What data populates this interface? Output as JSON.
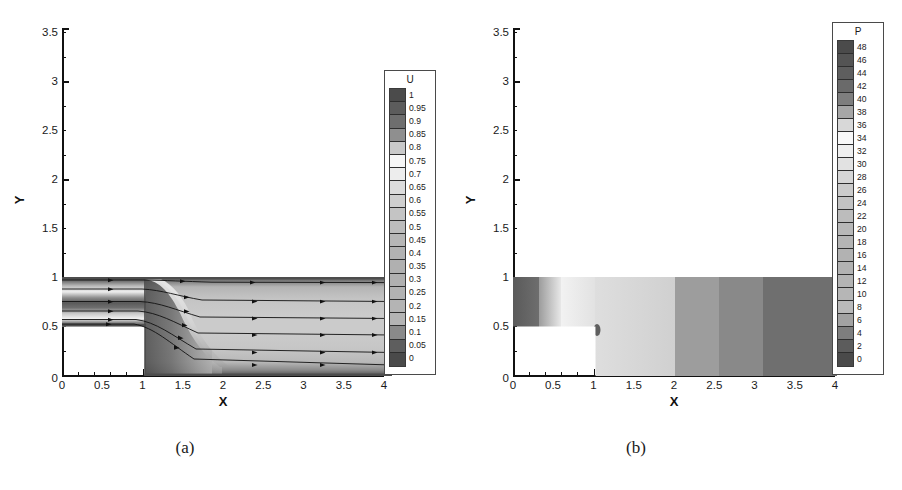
{
  "figure": {
    "panels": [
      {
        "id": "a",
        "caption": "(a)",
        "xlabel": "X",
        "ylabel": "Y",
        "xticks": [
          "0",
          "0.5",
          "1",
          "1.5",
          "2",
          "2.5",
          "3",
          "3.5",
          "4"
        ],
        "yticks": [
          "0",
          "0.5",
          "1",
          "1.5",
          "2",
          "2.5",
          "3",
          "3.5"
        ],
        "colorbar": {
          "title": "U",
          "labels": [
            "1",
            "0.95",
            "0.9",
            "0.85",
            "0.8",
            "0.75",
            "0.7",
            "0.65",
            "0.6",
            "0.55",
            "0.5",
            "0.45",
            "0.4",
            "0.35",
            "0.3",
            "0.25",
            "0.2",
            "0.15",
            "0.1",
            "0.05",
            "0"
          ],
          "colors": [
            "#4b4b4b",
            "#5c5c5c",
            "#6e6e6e",
            "#8f8f8f",
            "#c9c9c9",
            "#f6f6f6",
            "#ededed",
            "#dcdcdc",
            "#cfcfcf",
            "#c4c4c4",
            "#bcbcbc",
            "#b6b6b6",
            "#b2b2b2",
            "#b0b0b0",
            "#b0b0b0",
            "#b2b2b2",
            "#b4b4b4",
            "#b4b4b4",
            "#8a8a8a",
            "#5e5e5e",
            "#4a4a4a"
          ]
        }
      },
      {
        "id": "b",
        "caption": "(b)",
        "xlabel": "X",
        "ylabel": "Y",
        "xticks": [
          "0",
          "0.5",
          "1",
          "1.5",
          "2",
          "2.5",
          "3",
          "3.5",
          "4"
        ],
        "yticks": [
          "0",
          "0.5",
          "1",
          "1.5",
          "2",
          "2.5",
          "3",
          "3.5"
        ],
        "colorbar": {
          "title": "P",
          "labels": [
            "48",
            "46",
            "44",
            "42",
            "40",
            "38",
            "36",
            "34",
            "32",
            "30",
            "28",
            "26",
            "24",
            "22",
            "20",
            "18",
            "16",
            "14",
            "12",
            "10",
            "8",
            "6",
            "4",
            "2",
            "0"
          ],
          "colors": [
            "#4b4b4b",
            "#545454",
            "#5e5e5e",
            "#6a6a6a",
            "#7e7e7e",
            "#a6a6a6",
            "#d8d8d8",
            "#f8f8f8",
            "#efefef",
            "#e2e2e2",
            "#d6d6d6",
            "#cbcbcb",
            "#c2c2c2",
            "#bcbcbc",
            "#b8b8b8",
            "#b4b4b4",
            "#b2b2b2",
            "#b2b2b2",
            "#b4b4b4",
            "#b6b6b6",
            "#bababa",
            "#a2a2a2",
            "#7e7e7e",
            "#5c5c5c",
            "#4a4a4a"
          ]
        }
      }
    ]
  },
  "chart_data": {
    "type": "heatmap",
    "title": "",
    "panels": [
      {
        "id": "a",
        "field_variable": "U",
        "xlabel": "X",
        "ylabel": "Y",
        "xlim": [
          0,
          4
        ],
        "ylim": [
          0,
          3.7
        ],
        "xticks": [
          0,
          0.5,
          1,
          1.5,
          2,
          2.5,
          3,
          3.5,
          4
        ],
        "yticks": [
          0,
          0.5,
          1,
          1.5,
          2,
          2.5,
          3,
          3.5
        ],
        "grid": false,
        "legend_position": "right-outside",
        "colorbar_levels": [
          0,
          0.05,
          0.1,
          0.15,
          0.2,
          0.25,
          0.3,
          0.35,
          0.4,
          0.45,
          0.5,
          0.55,
          0.6,
          0.65,
          0.7,
          0.75,
          0.8,
          0.85,
          0.9,
          0.95,
          1
        ],
        "domain": {
          "inlet_channel": {
            "x": [
              0,
              1
            ],
            "y": [
              0.5,
              1.0
            ]
          },
          "expanded_channel": {
            "x": [
              1,
              4
            ],
            "y": [
              0.0,
              1.0
            ]
          },
          "step_block_blank": {
            "x": [
              0,
              1
            ],
            "y": [
              0.0,
              0.5
            ]
          }
        },
        "overlay": "streamlines",
        "streamline_start_y": [
          0.97,
          0.88,
          0.75,
          0.66,
          0.57,
          0.52
        ],
        "streamline_end_y": [
          0.94,
          0.78,
          0.6,
          0.42,
          0.24,
          0.1
        ],
        "annotations": []
      },
      {
        "id": "b",
        "field_variable": "P",
        "xlabel": "X",
        "ylabel": "Y",
        "xlim": [
          0,
          4
        ],
        "ylim": [
          0,
          3.7
        ],
        "xticks": [
          0,
          0.5,
          1,
          1.5,
          2,
          2.5,
          3,
          3.5,
          4
        ],
        "yticks": [
          0,
          0.5,
          1,
          1.5,
          2,
          2.5,
          3,
          3.5
        ],
        "grid": false,
        "legend_position": "right-outside",
        "colorbar_levels": [
          0,
          2,
          4,
          6,
          8,
          10,
          12,
          14,
          16,
          18,
          20,
          22,
          24,
          26,
          28,
          30,
          32,
          34,
          36,
          38,
          40,
          42,
          44,
          46,
          48
        ],
        "domain": {
          "inlet_channel": {
            "x": [
              0,
              1
            ],
            "y": [
              0.5,
              1.0
            ]
          },
          "expanded_channel": {
            "x": [
              1,
              4
            ],
            "y": [
              0.0,
              1.0
            ]
          },
          "step_block_blank": {
            "x": [
              0,
              1
            ],
            "y": [
              0.0,
              0.5
            ]
          }
        },
        "pressure_bands_x": [
          {
            "x": [
              0.0,
              0.3
            ],
            "P": 46
          },
          {
            "x": [
              0.3,
              0.55
            ],
            "P": 40
          },
          {
            "x": [
              0.55,
              1.0
            ],
            "P": 34
          },
          {
            "x": [
              1.0,
              2.0
            ],
            "P": 28
          },
          {
            "x": [
              2.0,
              2.55
            ],
            "P": 20
          },
          {
            "x": [
              2.55,
              3.1
            ],
            "P": 14
          },
          {
            "x": [
              3.1,
              4.0
            ],
            "P": 6
          }
        ],
        "annotations": []
      }
    ]
  }
}
